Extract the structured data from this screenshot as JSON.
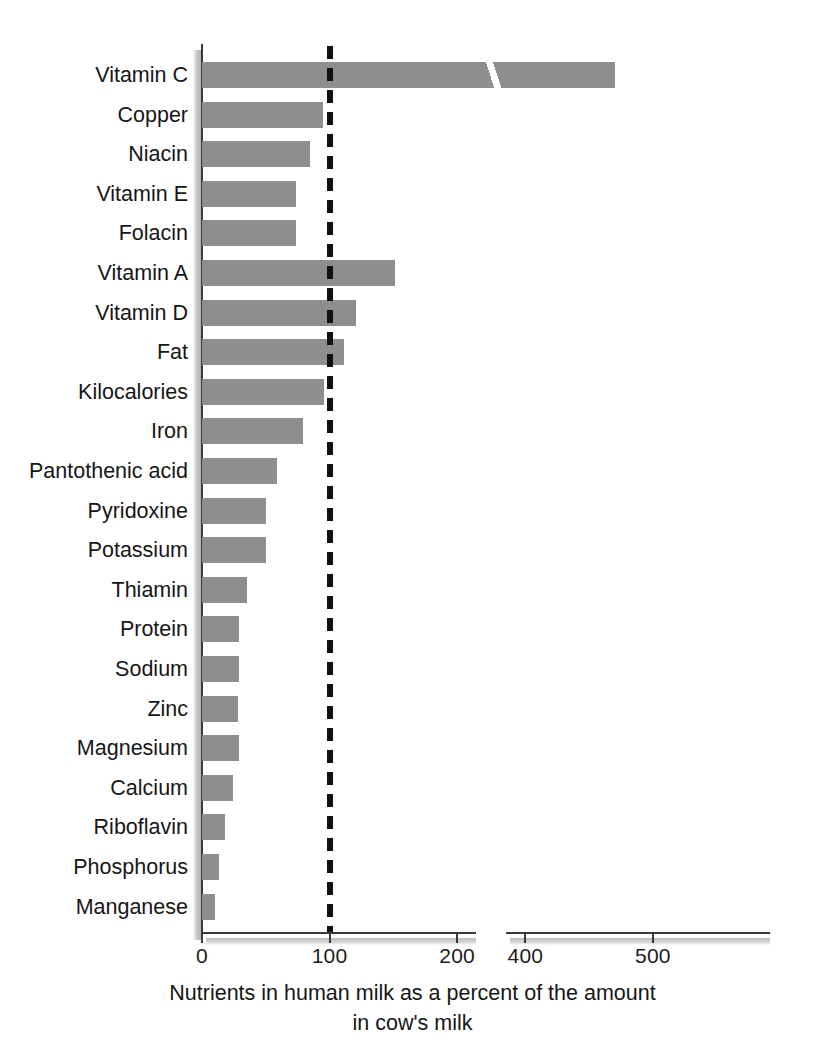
{
  "chart_data": {
    "type": "bar",
    "orientation": "horizontal",
    "title": "",
    "caption_line1": "Nutrients in human milk as a percent of the amount",
    "caption_line2": "in cow's milk",
    "xlabel": "",
    "ylabel": "",
    "xlim": [
      0,
      570
    ],
    "grid": false,
    "legend": "none",
    "axis_break": {
      "from": 215,
      "to": 385
    },
    "reference_line": {
      "value": 100,
      "style": "dashed",
      "color": "#111111"
    },
    "xticks": [
      0,
      100,
      200,
      400,
      500
    ],
    "xtick_labels": [
      "0",
      "100",
      "200",
      "400",
      "500"
    ],
    "categories": [
      "Vitamin C",
      "Copper",
      "Niacin",
      "Vitamin E",
      "Folacin",
      "Vitamin A",
      "Vitamin D",
      "Fat",
      "Kilocalories",
      "Iron",
      "Pantothenic acid",
      "Pyridoxine",
      "Potassium",
      "Thiamin",
      "Protein",
      "Sodium",
      "Zinc",
      "Magnesium",
      "Calcium",
      "Riboflavin",
      "Phosphorus",
      "Manganese"
    ],
    "values": [
      470,
      241,
      231,
      220,
      220,
      151,
      121,
      111,
      96,
      79,
      59,
      50,
      50,
      35,
      29,
      29,
      28,
      29,
      24,
      18,
      13,
      10
    ],
    "bar_color": "#8e8e8e",
    "bar_edge_color": "#8e8e8e",
    "background_color": "#ffffff",
    "text_color": "#161616"
  }
}
